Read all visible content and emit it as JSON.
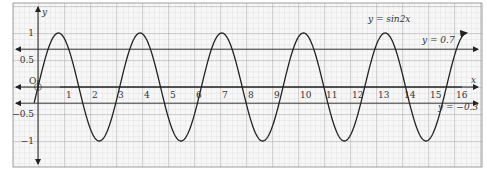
{
  "chart_data": {
    "type": "line",
    "title": "",
    "xlabel": "x",
    "ylabel": "y",
    "xlim": [
      -0.9,
      17.1
    ],
    "ylim": [
      -1.5,
      1.55
    ],
    "grid": true,
    "x_ticks": [
      "1",
      "2",
      "3",
      "4",
      "5",
      "6",
      "7",
      "8",
      "9",
      "10",
      "11",
      "12",
      "13",
      "14",
      "15",
      "16"
    ],
    "y_ticks": [
      {
        "value": 1,
        "label": "1"
      },
      {
        "value": 0.5,
        "label": "0.5"
      },
      {
        "value": -0.5,
        "label": "−0.5"
      },
      {
        "value": -1,
        "label": "−1"
      }
    ],
    "origin_label": "O",
    "series": [
      {
        "name": "y = sin2x",
        "function": "sin(2x)",
        "x_range": [
          -0.15,
          16.5
        ],
        "color": "#222222"
      },
      {
        "name": "y = 0.7",
        "function": "0.7",
        "color": "#333333"
      },
      {
        "name": "y = −0.3",
        "function": "-0.3",
        "color": "#333333"
      }
    ],
    "annotations": [
      {
        "text": "y = sin2x",
        "x": 13.6,
        "y": 1.25
      },
      {
        "text": "y = 0.7",
        "x": 15.2,
        "y": 0.72
      },
      {
        "text": "y = −0.3",
        "x": 15.7,
        "y": -0.42
      }
    ]
  },
  "labels": {
    "curve": "y = sin2x",
    "line_upper": "y = 0.7",
    "line_lower": "y = −0.3",
    "x_axis": "x",
    "y_axis": "y",
    "origin": "O"
  }
}
